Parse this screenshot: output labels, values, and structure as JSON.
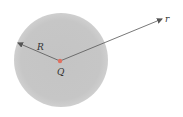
{
  "diagram": {
    "sphere": {
      "cx": 61,
      "cy": 60,
      "r": 47,
      "color": "#c8c8c8"
    },
    "charge": {
      "label": "Q",
      "color": "#d9534f"
    },
    "radius_label": "R",
    "vector_label": "r"
  }
}
